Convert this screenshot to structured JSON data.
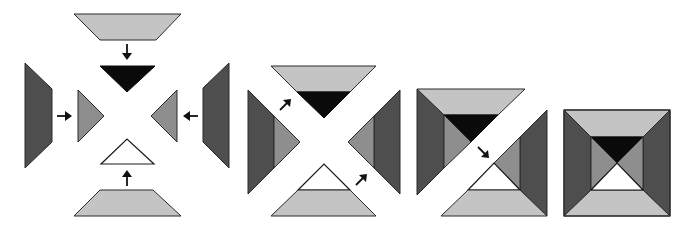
{
  "figure": {
    "colors": {
      "light_gray": "#c4c4c4",
      "medium_gray": "#8e8e8e",
      "dark_gray": "#4e4e4e",
      "black": "#0a0a0a",
      "white": "#ffffff"
    },
    "stages": [
      {
        "name": "stage-1-separate-pieces",
        "piece_count": 8
      },
      {
        "name": "stage-2-four-triangle-units",
        "piece_count": 4
      },
      {
        "name": "stage-3-two-half-units",
        "piece_count": 2
      },
      {
        "name": "stage-4-finished-block",
        "piece_count": 1
      }
    ]
  }
}
